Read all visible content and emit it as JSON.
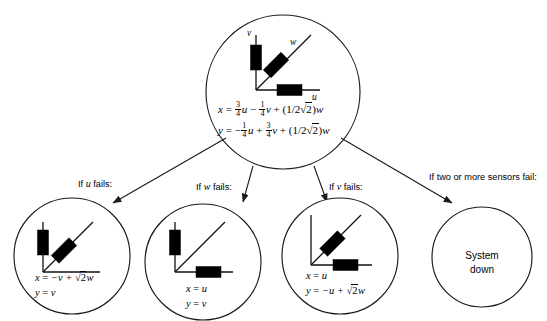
{
  "diagram": {
    "background_color": "#ffffff",
    "line_color": "#1a1a1a",
    "block_color": "#000000"
  },
  "root_node": {
    "name": "nominal-configuration",
    "axes": [
      {
        "label": "v",
        "orientation": "vertical",
        "has_sensor": true
      },
      {
        "label": "w",
        "orientation": "diagonal",
        "has_sensor": true
      },
      {
        "label": "u",
        "orientation": "horizontal",
        "has_sensor": true
      }
    ],
    "equation_x": {
      "lhs": "x",
      "eq": "=",
      "t1_num": "3",
      "t1_den": "4",
      "t1_var": "u",
      "op1": "−",
      "t2_num": "1",
      "t2_den": "4",
      "t2_var": "v",
      "op2": "+",
      "t3": "(1/2",
      "t3_radical": "√",
      "t3_radicand": "2",
      "t3_close": ")",
      "t3_var": "w"
    },
    "equation_y": {
      "lhs": "y",
      "eq": "=",
      "sign": "−",
      "t1_num": "1",
      "t1_den": "4",
      "t1_var": "u",
      "op1": "+",
      "t2_num": "3",
      "t2_den": "4",
      "t2_var": "v",
      "op2": "+",
      "t3": "(1/2",
      "t3_radical": "√",
      "t3_radicand": "2",
      "t3_close": ")",
      "t3_var": "w"
    }
  },
  "branches": [
    {
      "name": "branch-u-fails",
      "label_prefix": "If ",
      "label_var": "u",
      "label_suffix": " fails:"
    },
    {
      "name": "branch-w-fails",
      "label_prefix": "If ",
      "label_var": "w",
      "label_suffix": " fails:"
    },
    {
      "name": "branch-v-fails",
      "label_prefix": "If ",
      "label_var": "v",
      "label_suffix": " fails:"
    },
    {
      "name": "branch-multiple-fail",
      "label_prefix": "If two or more sensors fail:",
      "label_var": "",
      "label_suffix": ""
    }
  ],
  "leaf_nodes": [
    {
      "name": "node-u-failed",
      "axes": [
        {
          "label": "v",
          "orientation": "vertical",
          "has_sensor": true
        },
        {
          "label": "w",
          "orientation": "diagonal",
          "has_sensor": true
        },
        {
          "label": "u",
          "orientation": "horizontal",
          "has_sensor": false
        }
      ],
      "equation_x": {
        "lhs": "x",
        "eq": "=",
        "body": "−v + ",
        "radical": "√",
        "radicand": "2",
        "tail": "w"
      },
      "equation_y": {
        "lhs": "y",
        "eq": "=",
        "body": "v",
        "radical": "",
        "radicand": "",
        "tail": ""
      }
    },
    {
      "name": "node-w-failed",
      "axes": [
        {
          "label": "v",
          "orientation": "vertical",
          "has_sensor": true
        },
        {
          "label": "w",
          "orientation": "diagonal",
          "has_sensor": false
        },
        {
          "label": "u",
          "orientation": "horizontal",
          "has_sensor": true
        }
      ],
      "equation_x": {
        "lhs": "x",
        "eq": "=",
        "body": "u",
        "radical": "",
        "radicand": "",
        "tail": ""
      },
      "equation_y": {
        "lhs": "y",
        "eq": "=",
        "body": "v",
        "radical": "",
        "radicand": "",
        "tail": ""
      }
    },
    {
      "name": "node-v-failed",
      "axes": [
        {
          "label": "v",
          "orientation": "vertical",
          "has_sensor": false
        },
        {
          "label": "w",
          "orientation": "diagonal",
          "has_sensor": true
        },
        {
          "label": "u",
          "orientation": "horizontal",
          "has_sensor": true
        }
      ],
      "equation_x": {
        "lhs": "x",
        "eq": "=",
        "body": "u",
        "radical": "",
        "radicand": "",
        "tail": ""
      },
      "equation_y": {
        "lhs": "y",
        "eq": "=",
        "body": "−u + ",
        "radical": "√",
        "radicand": "2",
        "tail": "w"
      }
    },
    {
      "name": "node-system-down",
      "axes": [],
      "status_line1": "System",
      "status_line2": "down"
    }
  ]
}
